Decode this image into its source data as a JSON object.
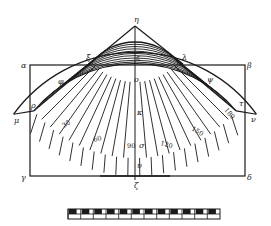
{
  "figure": {
    "ink_color": "#1a1a1a",
    "background": "#ffffff"
  },
  "points": {
    "eta": "η",
    "xi": "ξ",
    "lambda": "λ",
    "alpha": "α",
    "beta": "β",
    "gamma": "γ",
    "delta": "δ",
    "epsilon": "ε",
    "omicron": "ο",
    "kappa": "κ",
    "sigma": "σ",
    "upsilon": "υ",
    "zeta": "ζ",
    "rho": "ρ",
    "tau": "τ",
    "mu": "μ",
    "nu": "ν",
    "phi": "φ",
    "psi": "ψ"
  },
  "meridian_labels": [
    "30",
    "60",
    "90",
    "120",
    "150",
    "180"
  ],
  "scale_bar": {
    "segments": 12
  }
}
